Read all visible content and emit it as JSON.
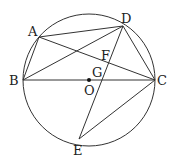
{
  "diagram": {
    "type": "circle-geometry",
    "circle": {
      "cx": 89,
      "cy": 80,
      "r": 66
    },
    "points": {
      "A": {
        "label": "A",
        "x": 39,
        "y": 37
      },
      "B": {
        "label": "B",
        "x": 23,
        "y": 80
      },
      "C": {
        "label": "C",
        "x": 155,
        "y": 80
      },
      "D": {
        "label": "D",
        "x": 123,
        "y": 26
      },
      "E": {
        "label": "E",
        "x": 79,
        "y": 139
      },
      "F": {
        "label": "F",
        "x": 108,
        "y": 58
      },
      "G": {
        "label": "G",
        "x": 103,
        "y": 80
      },
      "O": {
        "label": "O",
        "x": 89,
        "y": 80
      }
    },
    "segments": [
      [
        "A",
        "D"
      ],
      [
        "A",
        "B"
      ],
      [
        "A",
        "C"
      ],
      [
        "B",
        "D"
      ],
      [
        "B",
        "C"
      ],
      [
        "D",
        "C"
      ],
      [
        "D",
        "E"
      ],
      [
        "E",
        "C"
      ]
    ],
    "labels": {
      "A": "A",
      "B": "B",
      "C": "C",
      "D": "D",
      "E": "E",
      "F": "F",
      "G": "G",
      "O": "O"
    }
  }
}
